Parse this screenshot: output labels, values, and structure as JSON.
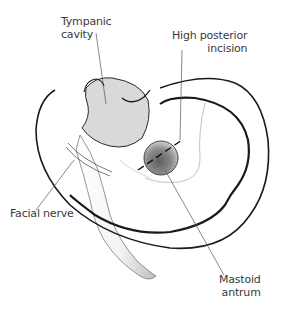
{
  "figure": {
    "labels": {
      "tympanic_cavity": {
        "line1": "Tympanic",
        "line2": "cavity"
      },
      "high_posterior_incision": {
        "line1": "High posterior",
        "line2": "incision"
      },
      "facial_nerve": {
        "line1": "Facial nerve"
      },
      "mastoid_antrum": {
        "line1": "Mastoid",
        "line2": "antrum"
      }
    },
    "colors": {
      "outline": "#1a1a1a",
      "leader_line": "#555555",
      "tympanic_fill": "#d9d9d9",
      "antrum_fill": "#7a7a7a",
      "canal_shade": "#cfcfcf"
    }
  }
}
